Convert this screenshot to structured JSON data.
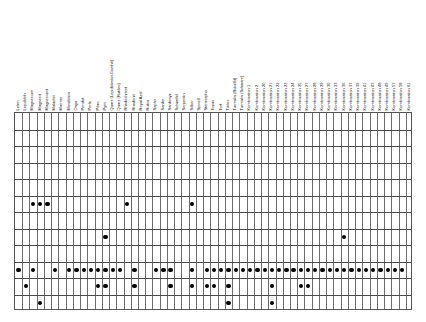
{
  "chart_data": {
    "type": "heatmap",
    "title": "",
    "xlabel": "",
    "ylabel": "",
    "grid": true,
    "legend": "none",
    "marker_color": "#000000",
    "columns": [
      "Lehm",
      "Lepidolith",
      "Magnesium",
      "Magnesit",
      "Magnesiusit",
      "Malachit",
      "Marmor",
      "Mondstein",
      "Onyx",
      "Peridot",
      "Perle",
      "Pilan",
      "Pyrit",
      "Quarz (Lepidokrokit-Goethit)",
      "Quarz (Rutilen)",
      "Rhodochrosit",
      "Rhodonit",
      "Royal Azel",
      "Rubin",
      "Saphir",
      "Sarder",
      "Sardonyx",
      "Schwefel",
      "Serpentin",
      "Silber",
      "Spinell",
      "Sternsaphir",
      "Topas",
      "Torf",
      "Türkis",
      "Turmalin (Rubellit)",
      "Turmalin (Schwarz)",
      "Kombination 1",
      "Kombination 2",
      "Kombination 20",
      "Kombination 21",
      "Kombination 22",
      "Kombination 23",
      "Kombination 24",
      "Kombination 25",
      "Kombination 27",
      "Kombination 28",
      "Kombination 29",
      "Kombination 30",
      "Kombination 33",
      "Kombination 36",
      "Kombination 37",
      "Kombination 39",
      "Kombination 41",
      "Kombination 43",
      "Kombination 48",
      "Kombination 49",
      "Kombination 57",
      "Kombination 58",
      "Kombination 61"
    ],
    "rows": [
      "row-1",
      "row-2",
      "row-3",
      "row-4",
      "row-5",
      "row-6",
      "row-7",
      "row-8",
      "row-9",
      "row-10",
      "row-11",
      "row-12"
    ],
    "row_band_heights": [
      16.5,
      16.5,
      16.5,
      16.5,
      16.5,
      16.5,
      16.5,
      16.5,
      16.5,
      16.5,
      16.5,
      16.5
    ],
    "points": [
      {
        "row": 5,
        "col": 2
      },
      {
        "row": 5,
        "col": 3
      },
      {
        "row": 5,
        "col": 4
      },
      {
        "row": 5,
        "col": 15
      },
      {
        "row": 5,
        "col": 24
      },
      {
        "row": 7,
        "col": 12
      },
      {
        "row": 7,
        "col": 45
      },
      {
        "row": 9,
        "col": 0
      },
      {
        "row": 9,
        "col": 2
      },
      {
        "row": 9,
        "col": 5
      },
      {
        "row": 9,
        "col": 7
      },
      {
        "row": 9,
        "col": 8
      },
      {
        "row": 9,
        "col": 9
      },
      {
        "row": 9,
        "col": 10
      },
      {
        "row": 9,
        "col": 11
      },
      {
        "row": 9,
        "col": 12
      },
      {
        "row": 9,
        "col": 13
      },
      {
        "row": 9,
        "col": 14
      },
      {
        "row": 9,
        "col": 16
      },
      {
        "row": 9,
        "col": 19
      },
      {
        "row": 9,
        "col": 20
      },
      {
        "row": 9,
        "col": 21
      },
      {
        "row": 9,
        "col": 24
      },
      {
        "row": 9,
        "col": 26
      },
      {
        "row": 9,
        "col": 27
      },
      {
        "row": 9,
        "col": 28
      },
      {
        "row": 9,
        "col": 29
      },
      {
        "row": 9,
        "col": 30
      },
      {
        "row": 9,
        "col": 31
      },
      {
        "row": 9,
        "col": 32
      },
      {
        "row": 9,
        "col": 33
      },
      {
        "row": 9,
        "col": 34
      },
      {
        "row": 9,
        "col": 35
      },
      {
        "row": 9,
        "col": 36
      },
      {
        "row": 9,
        "col": 37
      },
      {
        "row": 9,
        "col": 38
      },
      {
        "row": 9,
        "col": 39
      },
      {
        "row": 9,
        "col": 40
      },
      {
        "row": 9,
        "col": 41
      },
      {
        "row": 9,
        "col": 42
      },
      {
        "row": 9,
        "col": 43
      },
      {
        "row": 9,
        "col": 44
      },
      {
        "row": 9,
        "col": 45
      },
      {
        "row": 9,
        "col": 46
      },
      {
        "row": 9,
        "col": 47
      },
      {
        "row": 9,
        "col": 48
      },
      {
        "row": 9,
        "col": 49
      },
      {
        "row": 9,
        "col": 50
      },
      {
        "row": 9,
        "col": 51
      },
      {
        "row": 9,
        "col": 52
      },
      {
        "row": 9,
        "col": 53
      },
      {
        "row": 10,
        "col": 1
      },
      {
        "row": 10,
        "col": 11
      },
      {
        "row": 10,
        "col": 12
      },
      {
        "row": 10,
        "col": 16
      },
      {
        "row": 10,
        "col": 21
      },
      {
        "row": 10,
        "col": 24
      },
      {
        "row": 10,
        "col": 26
      },
      {
        "row": 10,
        "col": 27
      },
      {
        "row": 10,
        "col": 29
      },
      {
        "row": 10,
        "col": 35
      },
      {
        "row": 10,
        "col": 39
      },
      {
        "row": 10,
        "col": 40
      },
      {
        "row": 11,
        "col": 3
      },
      {
        "row": 11,
        "col": 29
      },
      {
        "row": 11,
        "col": 35
      }
    ]
  }
}
